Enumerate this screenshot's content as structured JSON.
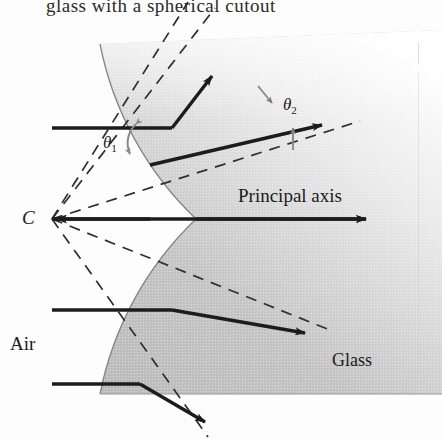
{
  "figure": {
    "caption": "glass with a spherical cutout",
    "labels": {
      "center_of_curvature": "C",
      "medium_left": "Air",
      "medium_right": "Glass",
      "axis": "Principal axis",
      "theta1_symbol": "θ",
      "theta1_sub": "1",
      "theta2_symbol": "θ",
      "theta2_sub": "2"
    },
    "colors": {
      "ray": "#1c1c1c",
      "normal_dashed": "#333333",
      "glass_fill": "#b6b6b6",
      "air_fill": "#ffffff",
      "angle_marker": "#8a8a8a",
      "boundary_stroke": "#6e6e6e",
      "text": "#1a1a1a"
    },
    "geometry": {
      "center_of_curvature_point": [
        52,
        219
      ],
      "surface_vertex": [
        196,
        219
      ],
      "incident_rays_y": [
        128,
        219,
        310,
        384
      ],
      "ray_start_x": 52,
      "sphere_center": [
        -120,
        219
      ],
      "sphere_radius": 330
    },
    "annotations": {
      "theta1_description": "angle of incidence between incident ray and normal",
      "theta2_description": "angle of refraction between refracted ray and normal"
    }
  }
}
